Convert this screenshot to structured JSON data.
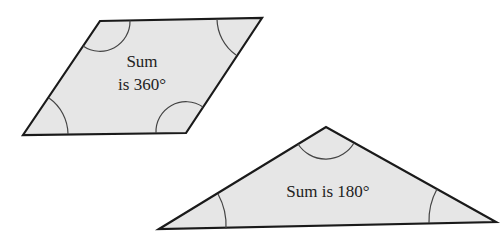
{
  "colors": {
    "fill": "#e6e6e6",
    "stroke": "#1a1a1a",
    "arc": "#444444",
    "text": "#222222"
  },
  "parallelogram": {
    "label_line1": "Sum",
    "label_line2": "is 360°"
  },
  "triangle": {
    "label": "Sum is 180°"
  }
}
